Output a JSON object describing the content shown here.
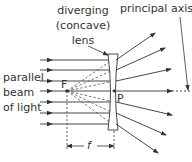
{
  "labels": {
    "diverging_line1": "diverging",
    "diverging_line2": "(concave)",
    "diverging_line3": "lens",
    "principal_axis": "principal axis",
    "parallel_line1": "parallel",
    "parallel_line2": "beam",
    "parallel_line3": "of light",
    "focal_point": "F",
    "pole": "P",
    "focal_length": "f"
  },
  "colors": {
    "ink": "#333333",
    "lens_fill": "#ffffff"
  },
  "geometry": {
    "axis_y": 91,
    "focal_x": 67,
    "lens_x": 114,
    "incoming_rays_y": [
      60,
      70,
      81,
      91,
      102,
      113,
      124
    ]
  }
}
